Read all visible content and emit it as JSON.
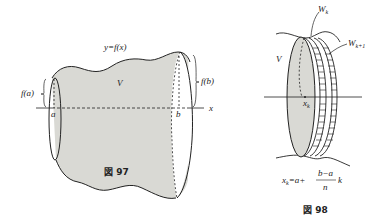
{
  "figure97": {
    "caption": "図 97",
    "curve_label": "y=f(x)",
    "volume_label": "V",
    "left_radius_label": "f(a)",
    "right_radius_label": "f(b)",
    "axis_label": "x",
    "left_point": "a",
    "right_point": "b",
    "fill_color": "#d9d9d4"
  },
  "figure98": {
    "caption": "図 98",
    "volume_label": "V",
    "slice_k_label": "W",
    "slice_k_sub": "k",
    "slice_k1_label": "W",
    "slice_k1_sub": "k+1",
    "point_label": "x",
    "point_sub": "k",
    "formula_lhs": "x",
    "formula_lhs_sub": "k",
    "formula_eq": "=a+",
    "formula_num": "b−a",
    "formula_den": "n",
    "formula_tail": "k",
    "fill_color": "#d9d9d4"
  }
}
